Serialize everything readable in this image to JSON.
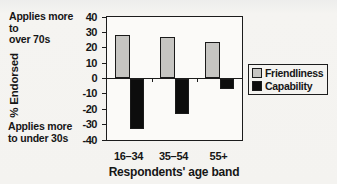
{
  "chart_data": {
    "type": "bar",
    "title": "",
    "categories": [
      "16–34",
      "35–54",
      "55+"
    ],
    "series": [
      {
        "name": "Friendliness",
        "color": "#c6c5c2",
        "values": [
          28,
          27,
          24
        ]
      },
      {
        "name": "Capability",
        "color": "#0d0d0d",
        "values": [
          -33,
          -23,
          -7
        ]
      }
    ],
    "xlabel": "Respondents' age band",
    "ylabel": "% Endorsed",
    "ylim": [
      -40,
      40
    ],
    "yticks": [
      40,
      30,
      20,
      10,
      0,
      -10,
      -20,
      -30,
      -40
    ],
    "grid": false,
    "legend_position": "right",
    "annotations": {
      "top_left": "Applies more\nto\nover 70s",
      "bottom_left": "Applies more\nto under 30s"
    }
  }
}
